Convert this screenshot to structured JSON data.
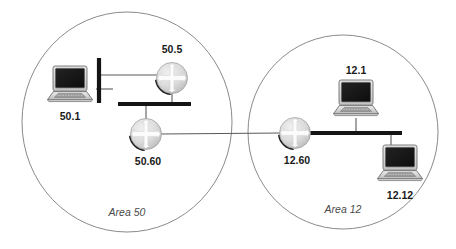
{
  "diagram": {
    "colors": {
      "area_circle_stroke": "#8a8a8a",
      "bus_bar": "#141414",
      "link_line": "#5a5a5a",
      "router_fill_light": "#e4e4e4",
      "router_fill_dark": "#b4b4b4",
      "router_shadow": "#1c1c1c",
      "laptop_screen": "#1a1a1a",
      "laptop_body": "#d9d9d9",
      "label_text": "#1a1a1a",
      "area_text": "#4a4a4a",
      "background": "#ffffff"
    },
    "areas": [
      {
        "id": "area-50",
        "label": "Area 50",
        "cx": 127,
        "cy": 122,
        "rx": 105,
        "ry": 110,
        "label_x": 127,
        "label_y": 213
      },
      {
        "id": "area-12",
        "label": "Area 12",
        "cx": 343,
        "cy": 132,
        "rx": 95,
        "ry": 97,
        "label_x": 343,
        "label_y": 210
      }
    ],
    "routers": [
      {
        "id": "router-50-5",
        "label": "50.5",
        "cx": 172,
        "cy": 78,
        "r": 17,
        "label_x": 172,
        "label_y": 50
      },
      {
        "id": "router-50-60",
        "label": "50.60",
        "cx": 146,
        "cy": 134,
        "r": 17,
        "label_x": 148,
        "label_y": 162
      },
      {
        "id": "router-12-60",
        "label": "12.60",
        "cx": 295,
        "cy": 133,
        "r": 17,
        "label_x": 297,
        "label_y": 161
      }
    ],
    "hosts": [
      {
        "id": "host-50-1",
        "label": "50.1",
        "cx": 70,
        "cy": 86,
        "w": 52,
        "h": 42,
        "label_x": 70,
        "label_y": 117
      },
      {
        "id": "host-12-1",
        "label": "12.1",
        "cx": 356,
        "cy": 100,
        "w": 52,
        "h": 42,
        "label_x": 356,
        "label_y": 71
      },
      {
        "id": "host-12-12",
        "label": "12.12",
        "cx": 400,
        "cy": 165,
        "w": 52,
        "h": 42,
        "label_x": 400,
        "label_y": 196
      }
    ],
    "segments": [
      {
        "id": "bus-area-50",
        "orientation": "horizontal",
        "x1": 118,
        "y1": 104,
        "x2": 191,
        "y2": 104
      },
      {
        "id": "bus-stub-50-1",
        "orientation": "vertical",
        "x1": 99,
        "y1": 58,
        "x2": 99,
        "y2": 103
      },
      {
        "id": "bus-area-12",
        "orientation": "horizontal",
        "x1": 307,
        "y1": 133,
        "x2": 402,
        "y2": 133
      }
    ],
    "links": [
      {
        "id": "link-50-1-to-stub",
        "x1": 99,
        "y1": 89,
        "x2": 112,
        "y2": 89
      },
      {
        "id": "link-stub-to-50-5",
        "x1": 99,
        "y1": 75,
        "x2": 155,
        "y2": 75
      },
      {
        "id": "link-50-5-to-bus",
        "x1": 172,
        "y1": 95,
        "x2": 172,
        "y2": 104
      },
      {
        "id": "link-bus-to-50-60",
        "x1": 146,
        "y1": 104,
        "x2": 146,
        "y2": 117
      },
      {
        "id": "link-50-60-to-12-60",
        "x1": 163,
        "y1": 134,
        "x2": 279,
        "y2": 133
      },
      {
        "id": "link-12-1-to-bus",
        "x1": 356,
        "y1": 122,
        "x2": 356,
        "y2": 133
      },
      {
        "id": "link-bus-to-12-12",
        "x1": 391,
        "y1": 133,
        "x2": 391,
        "y2": 144
      }
    ]
  }
}
